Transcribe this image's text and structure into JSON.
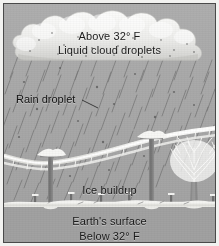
{
  "figure": {
    "background_color": "#a9a9a9",
    "frame_color": "#4a4a4a",
    "ground_color": "#a1a1a1",
    "ice_color": "#f4f4f2",
    "cloud_color": "#ededeb",
    "text_color": "#1b1b1b"
  },
  "labels": {
    "above_temp": "Above 32° F",
    "liquid_cloud_droplets": "Liquid cloud droplets",
    "rain_droplet": "Rain droplet",
    "ice_buildup": "Ice buildup",
    "earths_surface": "Earth's surface",
    "below_temp": "Below 32° F"
  },
  "scene": {
    "cloud": {
      "name": "cumulus-cloud",
      "description": "Puffy white cloud spanning the top of the frame with small dark droplet specks"
    },
    "rain": {
      "name": "rain-streaks",
      "description": "Diagonal rain streaks slanting down-left from the cloud base to the ground",
      "streak_count": 120,
      "angle_degrees": 72
    },
    "poles": [
      {
        "name": "utility-pole-left",
        "x": 47
      },
      {
        "name": "utility-pole-right",
        "x": 147
      }
    ],
    "wires": {
      "name": "ice-coated-wires",
      "description": "Sagging power lines coated in thick white ice between the utility poles"
    },
    "tree": {
      "name": "ice-coated-tree",
      "description": "Bare deciduous tree on the right with branches encased in ice"
    },
    "fence_posts": 6,
    "snow_layer": {
      "name": "snow-ice-ground-layer",
      "description": "White icy crust along the ground line"
    }
  }
}
